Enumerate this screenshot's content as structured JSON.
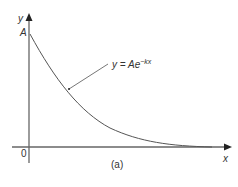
{
  "figure": {
    "y_axis_label": "y",
    "x_axis_label": "x",
    "origin_label": "0",
    "intercept_label": "A",
    "curve_label": {
      "lhs": "y = Ae",
      "exp": "−kx"
    },
    "caption": "(a)",
    "curve_color": "#555555",
    "axis_color": "#555555"
  }
}
